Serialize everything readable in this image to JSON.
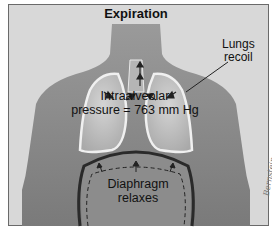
{
  "diagram": {
    "title": "Expiration",
    "labels": {
      "lungs_line1": "Lungs",
      "lungs_line2": "recoil",
      "pressure_line1": "Intraalveolar",
      "pressure_line2": "pressure = 763 mm Hg",
      "diaphragm_line1": "Diaphragm",
      "diaphragm_line2": "relaxes"
    },
    "signature": "Bernstein",
    "colors": {
      "background": "#d8d8d8",
      "torso": "#8a8a8a",
      "lungs": "#c4c4c4",
      "lung_outline": "#f0f0f0",
      "diaphragm": "#2a2a2a",
      "border": "#6a6a6a"
    }
  }
}
